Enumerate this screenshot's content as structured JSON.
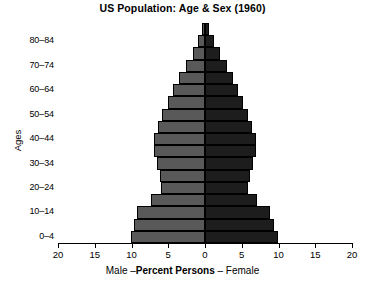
{
  "chart_data": {
    "type": "bar",
    "subtype": "population-pyramid",
    "title": "US Population:  Age & Sex (1960)",
    "xlabel_left": "Male –",
    "xlabel_center": "Percent Persons",
    "xlabel_right": "– Female",
    "ylabel": "Ages",
    "xlim": [
      -20,
      20
    ],
    "xtick_labels": [
      "20",
      "15",
      "10",
      "5",
      "0",
      "5",
      "10",
      "15",
      "20"
    ],
    "xtick_values": [
      -20,
      -15,
      -10,
      -5,
      0,
      5,
      10,
      15,
      20
    ],
    "grid": false,
    "legend": "none",
    "units": "percent of same-sex population",
    "colors": {
      "male": "#595959",
      "female": "#1d1d1d",
      "outline": "#000000",
      "background": "#ffffff"
    },
    "categories": [
      "0–4",
      "5–9",
      "10–14",
      "15–19",
      "20–24",
      "25–29",
      "30–34",
      "35–39",
      "40–44",
      "45–49",
      "50–54",
      "55–59",
      "60–64",
      "65–69",
      "70–74",
      "75–79",
      "80–84",
      "85+"
    ],
    "labeled_categories": [
      "0–4",
      "10–14",
      "20–24",
      "30–34",
      "40–44",
      "50–54",
      "60–64",
      "70–74",
      "80–84"
    ],
    "series": [
      {
        "name": "Male",
        "side": "left",
        "values": [
          10.1,
          9.7,
          9.2,
          7.3,
          6.0,
          6.1,
          6.5,
          7.0,
          6.9,
          6.4,
          5.8,
          5.1,
          4.3,
          3.5,
          2.6,
          1.7,
          0.9,
          0.4
        ]
      },
      {
        "name": "Female",
        "side": "right",
        "values": [
          9.9,
          9.4,
          8.9,
          7.1,
          5.9,
          6.1,
          6.5,
          7.0,
          6.9,
          6.4,
          5.8,
          5.2,
          4.5,
          3.8,
          3.0,
          2.1,
          1.2,
          0.6
        ]
      }
    ]
  }
}
